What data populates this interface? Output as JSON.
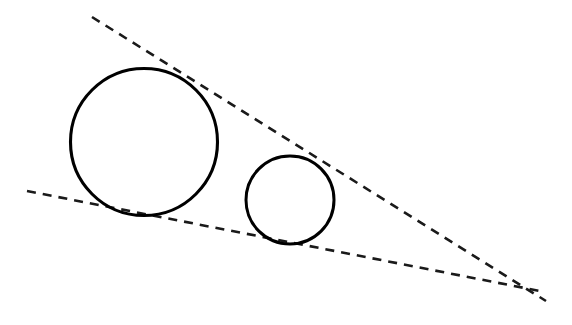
{
  "canvas": {
    "width": 572,
    "height": 325,
    "background_color": "#ffffff"
  },
  "figure": {
    "stroke_color": "#000000",
    "dash_color": "#1a1a1a"
  },
  "chart_data": {
    "type": "diagram",
    "xlabel": "",
    "ylabel": "",
    "xlim": [
      0,
      572
    ],
    "ylim": [
      325,
      0
    ],
    "grid": false,
    "legend": null,
    "shapes": [
      {
        "name": "large-circle",
        "type": "circle",
        "cx": 144,
        "cy": 142,
        "r": 73.5,
        "stroke": "#000000",
        "stroke_width": 3.1,
        "fill": "none",
        "dash": "none"
      },
      {
        "name": "small-circle",
        "type": "circle",
        "cx": 290,
        "cy": 200,
        "r": 44,
        "stroke": "#000000",
        "stroke_width": 3.0,
        "fill": "none",
        "dash": "none"
      },
      {
        "name": "upper-tangent-line",
        "type": "line",
        "x1": 92,
        "y1": 17,
        "x2": 546,
        "y2": 301,
        "stroke": "#1a1a1a",
        "stroke_width": 2.6,
        "dash": "9 7"
      },
      {
        "name": "lower-tangent-line",
        "type": "line",
        "x1": 27,
        "y1": 191,
        "x2": 545,
        "y2": 292,
        "stroke": "#1a1a1a",
        "stroke_width": 2.6,
        "dash": "9 7"
      }
    ],
    "annotations": [
      {
        "name": "tangency-upper-large",
        "x": 190,
        "y": 78,
        "note": "upper tangent touches large circle"
      },
      {
        "name": "tangency-upper-small",
        "x": 300,
        "y": 157,
        "note": "upper tangent touches small circle"
      },
      {
        "name": "tangency-lower-large",
        "x": 125,
        "y": 215,
        "note": "lower tangent touches large circle"
      },
      {
        "name": "tangency-lower-small",
        "x": 282,
        "y": 244,
        "note": "lower tangent touches small circle"
      },
      {
        "name": "external-homothetic-center",
        "x": 508,
        "y": 289,
        "note": "intersection of the two tangent lines"
      }
    ]
  }
}
